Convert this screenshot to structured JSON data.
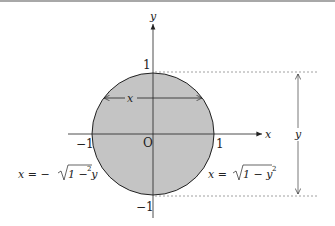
{
  "diagram": {
    "labels": {
      "y_axis": "y",
      "x_axis": "x",
      "origin": "O",
      "tick_pos_y": "1",
      "tick_neg_y": "−1",
      "tick_pos_x": "1",
      "tick_neg_x": "−1",
      "chord_label": "x",
      "height_label": "y",
      "left_eq_prefix": "x = −",
      "left_eq_rad": "1 − y",
      "right_eq_prefix": "x = ",
      "right_eq_rad": "1 − y",
      "exp": "2"
    },
    "colors": {
      "fill": "#c4c4c4",
      "stroke": "#222222",
      "dashed": "#888888"
    }
  }
}
